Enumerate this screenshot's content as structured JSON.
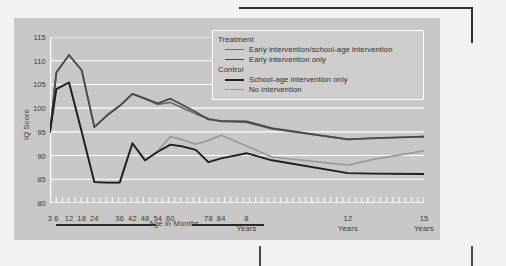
{
  "figure": {
    "background_color": "#c9c8c6",
    "page_color": "#f3f2f0"
  },
  "legend": {
    "groups": [
      {
        "title": "Treatment",
        "entries": [
          {
            "label": "Early intervention/school-age intervention",
            "color": "#6e6e6e"
          },
          {
            "label": "Early intervention only",
            "color": "#4a4a4a"
          }
        ]
      },
      {
        "title": "Control",
        "entries": [
          {
            "label": "School-age intervention only",
            "color": "#1f1f1f"
          },
          {
            "label": "No intervention",
            "color": "#9a9a9a"
          }
        ]
      }
    ]
  },
  "axis": {
    "y_title": "IQ Score",
    "y_ticks": [
      "80",
      "85",
      "90",
      "95",
      "100",
      "105",
      "110",
      "115"
    ],
    "x_month_labels": [
      "3",
      "6",
      "12",
      "18",
      "24",
      "36",
      "42",
      "48",
      "54",
      "60",
      "78",
      "84"
    ],
    "x_year_labels": [
      "8",
      "12",
      "15"
    ],
    "x_year_unit": "Years",
    "x_group_label": "Age in Months"
  },
  "chart_data": {
    "type": "line",
    "title": "",
    "xlabel": "Age in Months",
    "ylabel": "IQ Score",
    "ylim": [
      80,
      115
    ],
    "ytick_step": 5,
    "grid": true,
    "legend_position": "upper-right-inside",
    "x": [
      3,
      6,
      12,
      18,
      24,
      30,
      36,
      42,
      48,
      54,
      60,
      66,
      72,
      78,
      84,
      96,
      108,
      144,
      156,
      180
    ],
    "x_tick_labels": [
      "3",
      "6",
      "12",
      "18",
      "24",
      "",
      "36",
      "42",
      "48",
      "54",
      "60",
      "",
      "",
      "78",
      "84",
      "8 Years",
      "",
      "12 Years",
      "",
      "15 Years"
    ],
    "series": [
      {
        "name": "Early intervention/school-age intervention",
        "group": "Treatment",
        "color": "#6e6e6e",
        "values": [
          95.0,
          107.5,
          111.2,
          108.0,
          96.0,
          98.5,
          100.5,
          103.0,
          102.0,
          100.8,
          101.2,
          100.0,
          98.8,
          97.8,
          97.2,
          97.0,
          95.6,
          93.4,
          93.6,
          94.0
        ]
      },
      {
        "name": "Early intervention only",
        "group": "Treatment",
        "color": "#4a4a4a",
        "values": [
          95.0,
          107.5,
          111.2,
          108.0,
          96.0,
          98.5,
          100.5,
          103.0,
          102.0,
          101.0,
          102.0,
          100.6,
          99.2,
          97.6,
          97.3,
          97.2,
          95.8,
          93.4,
          93.7,
          94.0
        ]
      },
      {
        "name": "School-age intervention only",
        "group": "Control",
        "color": "#1f1f1f",
        "values": [
          95.0,
          104.0,
          105.4,
          95.0,
          84.4,
          84.3,
          84.3,
          92.6,
          89.0,
          90.8,
          92.3,
          91.9,
          91.2,
          88.6,
          89.4,
          90.5,
          89.0,
          86.3,
          86.2,
          86.1
        ]
      },
      {
        "name": "No intervention",
        "group": "Control",
        "color": "#9a9a9a",
        "values": [
          95.0,
          104.0,
          105.4,
          95.0,
          84.4,
          84.3,
          84.3,
          92.6,
          89.0,
          91.0,
          94.0,
          93.3,
          92.4,
          93.2,
          94.3,
          92.0,
          89.7,
          88.0,
          89.2,
          91.0
        ]
      }
    ]
  }
}
